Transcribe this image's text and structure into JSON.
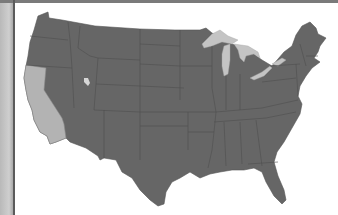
{
  "map": {
    "title": "",
    "region": "Contiguous United States",
    "colors": {
      "background": "#ffffff",
      "state_default": "#666666",
      "state_highlight": "#b3b3b3",
      "state_border": "#4f4f4f",
      "water": "#c4c4c4",
      "frame": "#5b5b5b"
    },
    "highlighted_states": [
      "California"
    ],
    "water_features": [
      "Great Lakes",
      "Great Salt Lake"
    ]
  }
}
